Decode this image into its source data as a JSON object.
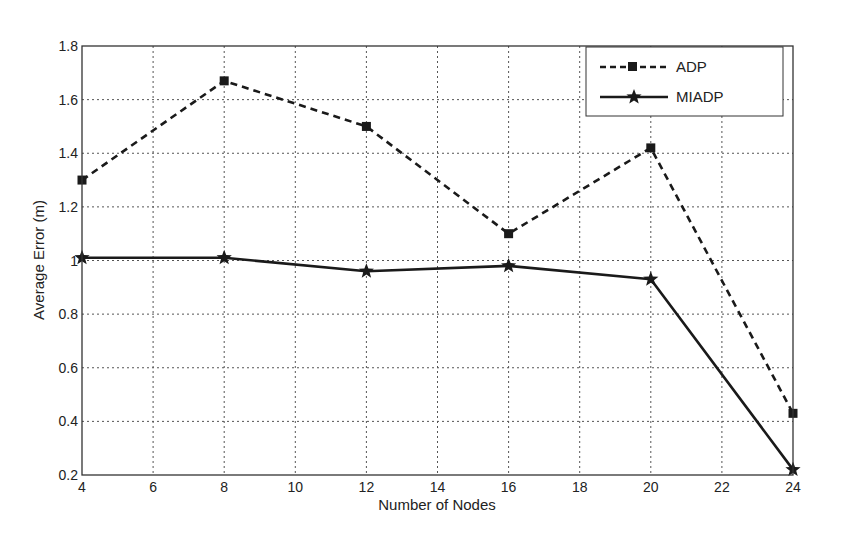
{
  "chart_data": {
    "type": "line",
    "title": "",
    "xlabel": "Number of Nodes",
    "ylabel": "Average Error (m)",
    "x": [
      4,
      8,
      12,
      16,
      20,
      24
    ],
    "xlim": [
      4,
      24
    ],
    "ylim": [
      0.2,
      1.8
    ],
    "xticks": [
      4,
      6,
      8,
      10,
      12,
      14,
      16,
      18,
      20,
      22,
      24
    ],
    "yticks": [
      0.2,
      0.4,
      0.6,
      0.8,
      1,
      1.2,
      1.4,
      1.6,
      1.8
    ],
    "ytick_labels": [
      "0.2",
      "0.4",
      "0.6",
      "0.8",
      "1",
      "1.2",
      "1.4",
      "1.6",
      "1.8"
    ],
    "grid": true,
    "legend_position": "upper right",
    "series": [
      {
        "name": "ADP",
        "values": [
          1.3,
          1.67,
          1.5,
          1.1,
          1.42,
          0.43
        ],
        "line_style": "dashed",
        "marker": "square",
        "color": "#1a1a1a"
      },
      {
        "name": "MIADP",
        "values": [
          1.01,
          1.01,
          0.96,
          0.98,
          0.93,
          0.22
        ],
        "line_style": "solid",
        "marker": "star",
        "color": "#1a1a1a"
      }
    ]
  },
  "legend": {
    "items": [
      {
        "label": "ADP"
      },
      {
        "label": "MIADP"
      }
    ]
  },
  "axes": {
    "xlabel": "Number of Nodes",
    "ylabel": "Average Error (m)"
  }
}
